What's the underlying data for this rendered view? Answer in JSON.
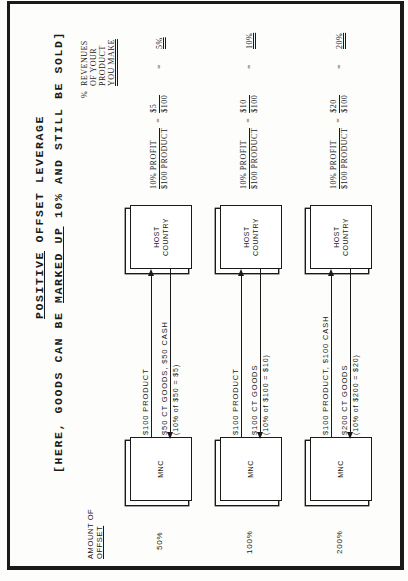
{
  "document": {
    "title_prefix": "POSITIVE",
    "title_rest": " OFFSET LEVERAGE",
    "subtitle_pre": "[HERE, GOODS CAN BE ",
    "subtitle_marked": "MARKED UP",
    "subtitle_post": " 10% AND STILL BE SOLD]",
    "amount_label_line1": "AMOUNT OF",
    "amount_label_line2": "OFFSET",
    "revenues_label": {
      "symbol": "%",
      "line1": "REVENUES",
      "line2": "OF YOUR",
      "line3": "PRODUCT",
      "line4": "YOU MAKE"
    },
    "rows": [
      {
        "amount": "50%",
        "mnc_label": "MNC",
        "host_label_line1": "HOST",
        "host_label_line2": "COUNTRY",
        "flow_to_host": "$100 PRODUCT",
        "flow_to_mnc": "$50 CT GOODS,  $50 CASH",
        "flow_note": "(10% of $50 = $5)",
        "formula_num_left": "10% PROFIT",
        "formula_den_left": "$100 PRODUCT",
        "formula_num_right": "$5",
        "formula_den_right": "$100",
        "equals": "=",
        "result": "5%"
      },
      {
        "amount": "100%",
        "mnc_label": "MNC",
        "host_label_line1": "HOST",
        "host_label_line2": "COUNTRY",
        "flow_to_host": "$100 PRODUCT",
        "flow_to_mnc": "$100 CT GOODS",
        "flow_note": "(10% of $100 = $10)",
        "formula_num_left": "10% PROFIT",
        "formula_den_left": "$100 PRODUCT",
        "formula_num_right": "$10",
        "formula_den_right": "$100",
        "equals": "=",
        "result": "10%"
      },
      {
        "amount": "200%",
        "mnc_label": "MNC",
        "host_label_line1": "HOST",
        "host_label_line2": "COUNTRY",
        "flow_to_host": "$100 PRODUCT,  $100 CASH",
        "flow_to_mnc": "$200 CT GOODS",
        "flow_note": "(10% of $200 = $20)",
        "formula_num_left": "10% PROFIT",
        "formula_den_left": "$100 PRODUCT",
        "formula_num_right": "$20",
        "formula_den_right": "$100",
        "equals": "=",
        "result": "20%"
      }
    ]
  }
}
